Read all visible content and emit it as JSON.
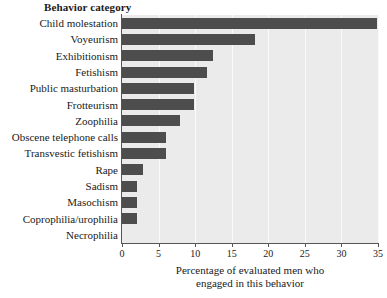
{
  "chart_data": {
    "type": "bar",
    "orientation": "horizontal",
    "title": "",
    "category_axis_title": "Behavior category",
    "xlabel_line1": "Percentage of evaluated men who",
    "xlabel_line2": "engaged in this behavior",
    "ylabel": "Behavior category",
    "xlim": [
      0,
      35
    ],
    "xticks": [
      0,
      5,
      10,
      15,
      20,
      25,
      30,
      35
    ],
    "xtick_labels": [
      "0",
      "5",
      "10",
      "15",
      "20",
      "25",
      "30",
      "35"
    ],
    "grid": "vertical",
    "legend": "none",
    "bar_color": "#4d4d4d",
    "plot_background": "#ebebeb",
    "gridline_color": "#fafafa",
    "axis_color": "#565656",
    "categories": [
      "Child molestation",
      "Voyeurism",
      "Exhibitionism",
      "Fetishism",
      "Public masturbation",
      "Frotteurism",
      "Zoophilia",
      "Obscene telephone calls",
      "Transvestic fetishism",
      "Rape",
      "Sadism",
      "Masochism",
      "Coprophilia/urophilia",
      "Necrophilia"
    ],
    "values": [
      34.9,
      18.2,
      12.4,
      11.6,
      9.9,
      9.9,
      7.9,
      6.0,
      6.0,
      2.9,
      2.0,
      2.0,
      2.0,
      0
    ]
  }
}
